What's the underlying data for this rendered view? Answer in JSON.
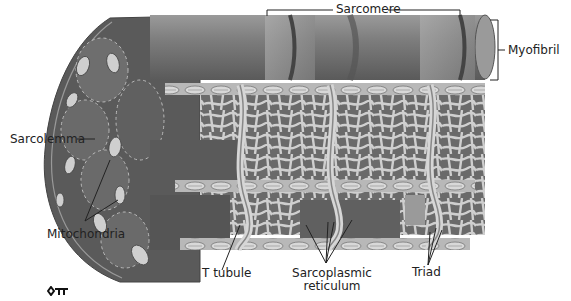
{
  "diagram": {
    "labels": {
      "sarcomere": "Sarcomere",
      "myofibril": "Myofibril",
      "sarcolemma": "Sarcolemma",
      "mitochondria": "Mitochondria",
      "t_tubule": "T tubule",
      "sarcoplasmic_reticulum_line1": "Sarcoplasmic",
      "sarcoplasmic_reticulum_line2": "reticulum",
      "triad": "Triad"
    },
    "key_icon": "key-icon"
  },
  "colors": {
    "fiber_dark": "#5e5e5e",
    "fiber_mid": "#7a7a7a",
    "fiber_light": "#a8a8a8",
    "reticulum": "#c9c9c9",
    "line": "#222222"
  }
}
